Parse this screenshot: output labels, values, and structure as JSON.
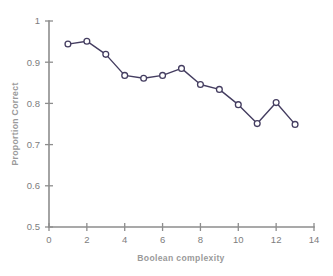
{
  "chart_data": {
    "type": "line",
    "title": "",
    "subtitle": "",
    "xlabel": "Boolean complexity",
    "ylabel": "Proportion Correct",
    "xlim": [
      0,
      14
    ],
    "ylim": [
      0.5,
      1
    ],
    "xticks": [
      0,
      2,
      4,
      6,
      8,
      10,
      12,
      14
    ],
    "xtick_labels": [
      "0",
      "2",
      "4",
      "6",
      "8",
      "10",
      "12",
      "14"
    ],
    "yticks": [
      0.5,
      0.6,
      0.7,
      0.8,
      0.9,
      1.0
    ],
    "ytick_labels": [
      "0.5",
      "0.6",
      "0.7",
      "0.8",
      "0.9",
      "1"
    ],
    "grid": false,
    "legend": false,
    "legend_position": "none",
    "marker": "open-circle",
    "x": [
      1,
      2,
      3,
      4,
      5,
      6,
      7,
      8,
      9,
      10,
      11,
      12,
      13
    ],
    "values": [
      0.944,
      0.951,
      0.919,
      0.868,
      0.861,
      0.868,
      0.885,
      0.846,
      0.834,
      0.797,
      0.751,
      0.802,
      0.749
    ],
    "series": [
      {
        "name": "Proportion Correct",
        "x": [
          1,
          2,
          3,
          4,
          5,
          6,
          7,
          8,
          9,
          10,
          11,
          12,
          13
        ],
        "values": [
          0.944,
          0.951,
          0.919,
          0.868,
          0.861,
          0.868,
          0.885,
          0.846,
          0.834,
          0.797,
          0.751,
          0.802,
          0.749
        ]
      }
    ],
    "annotations": []
  },
  "colors": {
    "line": "#443d60",
    "marker_stroke": "#443d60",
    "marker_fill": "#ffffff",
    "axis": "#8d8d8d",
    "tick_label": "#7d7d7d",
    "axis_title": "#9a9a9a",
    "background": "#ffffff"
  }
}
